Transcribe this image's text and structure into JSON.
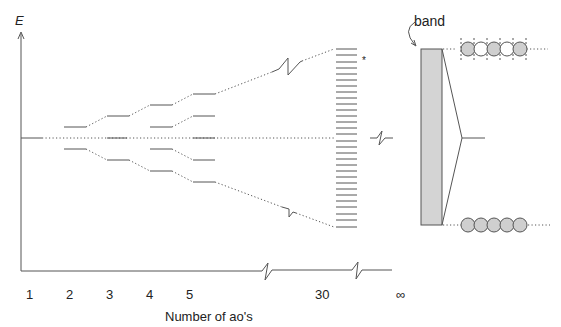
{
  "diagram": {
    "type": "energy-level diagram: formation of a band from atomic orbitals",
    "axis": {
      "y_label": "E",
      "x_label": "Number of ao's",
      "x_ticks": [
        "1",
        "2",
        "3",
        "4",
        "5",
        "30",
        "∞"
      ]
    },
    "band_label": "band",
    "star_marker": "*",
    "levels": {
      "n1": [
        0
      ],
      "n2": [
        1,
        -1
      ],
      "n3": [
        2,
        0,
        -2
      ],
      "n4": [
        3,
        1,
        -1,
        -3
      ],
      "n5": [
        4,
        2,
        0,
        -2,
        -4
      ],
      "n30_count": 30
    },
    "chains": {
      "top_pattern": [
        "filled",
        "empty",
        "filled",
        "empty",
        "filled"
      ],
      "bottom_pattern": [
        "filled",
        "filled",
        "filled",
        "filled",
        "filled"
      ]
    },
    "colors": {
      "line": "#555555",
      "band_fill": "#d4d4d4",
      "circle_fill": "#cfcfcf",
      "circle_empty": "#ffffff"
    }
  }
}
